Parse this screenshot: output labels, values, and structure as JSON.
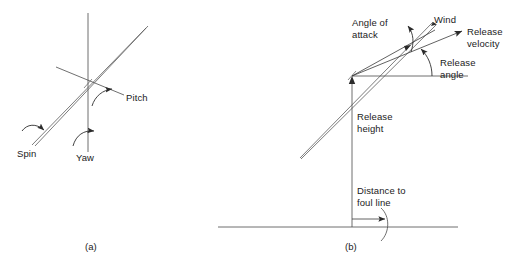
{
  "figure": {
    "type": "technical-diagram",
    "background_color": "#ffffff",
    "line_color": "#3a3a3a",
    "text_color": "#1b1b1b"
  },
  "panel_a": {
    "caption": "(a)",
    "labels": {
      "pitch": "Pitch",
      "yaw": "Yaw",
      "spin": "Spin"
    },
    "axes": [
      {
        "name": "yaw-axis",
        "orientation": "vertical"
      },
      {
        "name": "pitch-axis",
        "orientation": "diagonal-shallow"
      },
      {
        "name": "spin-axis",
        "orientation": "diagonal-steep-javelin"
      }
    ]
  },
  "panel_b": {
    "caption": "(b)",
    "labels": {
      "angle_of_attack": "Angle of\nattack",
      "wind": "Wind",
      "release_velocity": "Release\nvelocity",
      "release_angle": "Release\nangle",
      "release_height": "Release\nheight",
      "distance_to_foul_line": "Distance to\nfoul line"
    },
    "vectors": [
      {
        "name": "javelin-long-axis",
        "label": "Angle of attack"
      },
      {
        "name": "wind-vector",
        "label": "Wind"
      },
      {
        "name": "release-velocity-vector",
        "label": "Release velocity"
      }
    ],
    "angles": [
      {
        "name": "angle-of-attack-arc",
        "between": [
          "javelin-long-axis",
          "release-velocity-vector"
        ]
      },
      {
        "name": "release-angle-arc",
        "between": [
          "horizontal-reference",
          "release-velocity-vector"
        ]
      }
    ],
    "measures": [
      {
        "name": "release-height",
        "orientation": "vertical"
      },
      {
        "name": "distance-to-foul-line",
        "orientation": "horizontal"
      }
    ],
    "ground_line": "foul-line-ground"
  }
}
